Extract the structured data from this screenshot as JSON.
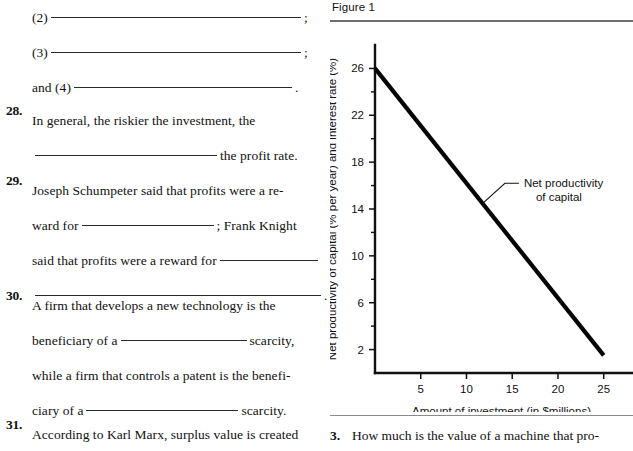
{
  "left_column": {
    "continued_item": {
      "lines": [
        {
          "prefix": "(2)",
          "blank": "b-w250",
          "suffix": ";"
        },
        {
          "prefix": "(3)",
          "blank": "b-w250",
          "suffix": ";"
        },
        {
          "prefix": "and (4)",
          "blank": "b-w218",
          "suffix": "."
        }
      ]
    },
    "questions": [
      {
        "number": "28.",
        "lines": [
          {
            "text": "In general, the riskier the investment, the"
          },
          {
            "pre": "",
            "blank": "b-w182",
            "post": "the profit rate."
          }
        ]
      },
      {
        "number": "29.",
        "lines": [
          {
            "text": "Joseph Schumpeter said that profits were a re-"
          },
          {
            "pre": "ward for",
            "blank": "b-w132",
            "post": "; Frank Knight"
          },
          {
            "pre": "said that profits were a reward for",
            "blank": "b-w98",
            "post": ""
          },
          {
            "pre": "",
            "blank": "b-w286",
            "post": "."
          }
        ]
      },
      {
        "number": "30.",
        "lines": [
          {
            "text": "A firm that develops a new technology is the"
          },
          {
            "pre": "beneficiary of a",
            "blank": "b-w126",
            "post": "scarcity,"
          },
          {
            "text": "while a firm that controls a patent is the benefi-"
          },
          {
            "pre": "ciary of a",
            "blank": "b-w152",
            "post": "scarcity."
          }
        ]
      },
      {
        "number": "31.",
        "lines": [
          {
            "text": "According to Karl Marx, surplus value is created"
          }
        ]
      }
    ]
  },
  "figure": {
    "caption": "Figure 1"
  },
  "next_question": {
    "number": "3.",
    "text": "How much is the value of a machine that pro-"
  },
  "chart_data": {
    "type": "line",
    "title": "Figure 1",
    "xlabel": "Amount of investment (in $millions)",
    "ylabel": "Net productivity of capital (% per year) and interest rate (%)",
    "xlim": [
      0,
      27
    ],
    "ylim": [
      0,
      28
    ],
    "x_ticks_major": [
      5,
      10,
      15,
      20,
      25
    ],
    "x_tick_labels": [
      "5",
      "10",
      "15",
      "20",
      "25"
    ],
    "y_ticks_major": [
      2,
      6,
      10,
      14,
      18,
      22,
      26
    ],
    "y_tick_labels": [
      "2",
      "6",
      "10",
      "14",
      "18",
      "22",
      "26"
    ],
    "y_ticks_minor": [
      4,
      8,
      12,
      16,
      20,
      24
    ],
    "grid": false,
    "legend": "none",
    "series": [
      {
        "name": "Net productivity of capital",
        "color": "#050505",
        "x": [
          0,
          25
        ],
        "y": [
          26,
          1.5
        ]
      }
    ],
    "annotations": [
      {
        "label_line1": "Net productivity",
        "label_line2": "of capital",
        "leader_from_x": 11.8,
        "leader_from_y": 14.5,
        "leader_to_x": 14.2,
        "leader_to_y": 16.2
      }
    ]
  }
}
